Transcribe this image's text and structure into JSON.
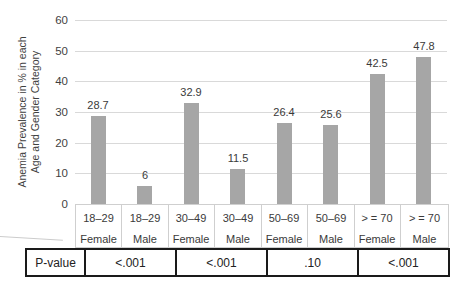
{
  "chart_data": {
    "type": "bar",
    "title": "",
    "ylabel_lines": [
      "Anemia Prevalence in % in each",
      "Age and Gender Category"
    ],
    "categories": [
      {
        "age": "18–29",
        "gender": "Female"
      },
      {
        "age": "18–29",
        "gender": "Male"
      },
      {
        "age": "30–49",
        "gender": "Female"
      },
      {
        "age": "30–49",
        "gender": "Male"
      },
      {
        "age": "50–69",
        "gender": "Female"
      },
      {
        "age": "50–69",
        "gender": "Male"
      },
      {
        "age": "> = 70",
        "gender": "Female"
      },
      {
        "age": "> = 70",
        "gender": "Male"
      }
    ],
    "values": [
      28.7,
      6,
      32.9,
      11.5,
      26.4,
      25.6,
      42.5,
      47.8
    ],
    "value_labels": [
      "28.7",
      "6",
      "32.9",
      "11.5",
      "26.4",
      "25.6",
      "42.5",
      "47.8"
    ],
    "ylim": [
      0,
      60
    ],
    "yticks": [
      0,
      10,
      20,
      30,
      40,
      50,
      60
    ],
    "grid": true,
    "legend": "none",
    "bar_color": "#a6a6a6",
    "gridline_color": "#d9d9d9"
  },
  "p_table": {
    "row_label": "P-value",
    "values": [
      "<.001",
      "<.001",
      ".10",
      "<.001"
    ],
    "span_per_value": 2
  }
}
